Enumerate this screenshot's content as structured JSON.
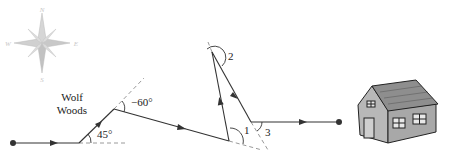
{
  "compass": {
    "north": "N",
    "south": "S",
    "east": "E",
    "west": "W"
  },
  "labels": {
    "wolf_woods_line1": "Wolf",
    "wolf_woods_line2": "Woods",
    "angle_45": "45°",
    "angle_neg60": "−60°",
    "angle_1": "1",
    "angle_2": "2",
    "angle_3": "3"
  },
  "colors": {
    "path": "#333333",
    "dashed": "#999999",
    "compass": "#c8c8c8",
    "house_wall": "#b8b8b8",
    "house_roof": "#909090"
  }
}
